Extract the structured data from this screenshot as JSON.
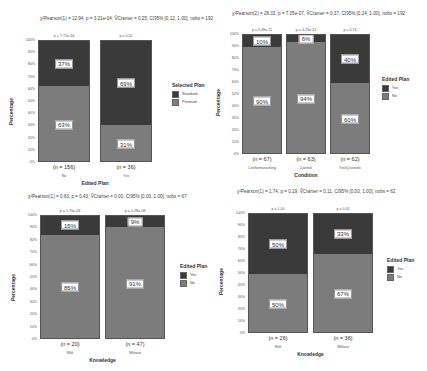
{
  "colors": {
    "dark": "#3a3a3a",
    "light": "#7c7c7c",
    "background": "#ffffff"
  },
  "yticks": [
    "100%",
    "90%",
    "80%",
    "70%",
    "60%",
    "50%",
    "40%",
    "30%",
    "20%",
    "10%",
    "0%"
  ],
  "panels": [
    {
      "subtitle": "χ²Pearson(1) = 12.94, p = 3.21e-04, V̂Cramer = 0.25, CI95% [0.12, 1.00], nobs = 192",
      "ylabel": "Percentage",
      "xlabel": "Edited Plan",
      "legend": {
        "title": "Selected Plan",
        "items": [
          {
            "label": "Standard"
          },
          {
            "label": "Premium"
          }
        ]
      },
      "bars": [
        {
          "category": "No",
          "n": "(n = 156)",
          "p": "p = 7.72e-04",
          "top_pct": 37,
          "bottom_pct": 63,
          "top_label": "37%",
          "bottom_label": "63%"
        },
        {
          "category": "Yes",
          "n": "(n = 36)",
          "p": "p = 0.02",
          "top_pct": 69,
          "bottom_pct": 31,
          "top_label": "69%",
          "bottom_label": "31%"
        }
      ]
    },
    {
      "subtitle": "χ²Pearson(2) = 28.33, p = 7.05e-07, V̂Cramer = 0.37, CI95% [0.24, 1.00], nobs = 192",
      "ylabel": "Percentage",
      "xlabel": "Condition",
      "legend": {
        "title": "Edited Plan",
        "items": [
          {
            "label": "Yes"
          },
          {
            "label": "No"
          }
        ]
      },
      "bars": [
        {
          "category": "Conformanarning",
          "n": "(n = 67)",
          "p": "p = 9.48e-11",
          "top_pct": 10,
          "bottom_pct": 90,
          "top_label": "10%",
          "bottom_label": "90%"
        },
        {
          "category": "Control",
          "n": "(n = 63)",
          "p": "p = 4.23e-12",
          "top_pct": 6,
          "bottom_pct": 94,
          "top_label": "6%",
          "bottom_label": "94%"
        },
        {
          "category": "TrickQuestion",
          "n": "(n = 62)",
          "p": "p = 0.13",
          "top_pct": 40,
          "bottom_pct": 60,
          "top_label": "40%",
          "bottom_label": "60%"
        }
      ]
    },
    {
      "subtitle": "χ²Pearson(1) = 0.63, p = 0.43, V̂Cramer = 0.00, CI95% [0.00, 1.00], nobs = 67",
      "ylabel": "Percentage",
      "xlabel": "Knowledge",
      "legend": {
        "title": "Edited Plan",
        "items": [
          {
            "label": "Yes"
          },
          {
            "label": "No"
          }
        ]
      },
      "bars": [
        {
          "category": "With",
          "n": "(n = 20)",
          "p": "p = 1.75e-03",
          "top_pct": 15,
          "bottom_pct": 85,
          "top_label": "15%",
          "bottom_label": "85%"
        },
        {
          "category": "Without",
          "n": "(n = 47)",
          "p": "p = 1.28e-08",
          "top_pct": 9,
          "bottom_pct": 91,
          "top_label": "9%",
          "bottom_label": "91%"
        }
      ]
    },
    {
      "subtitle": "χ²Pearson(1) = 1.74, p = 0.19, V̂Cramer = 0.11, CI95% [0.00, 1.00], nobs = 62",
      "ylabel": "Percentage",
      "xlabel": "Knowledge",
      "legend": {
        "title": "Edited Plan",
        "items": [
          {
            "label": "Yes"
          },
          {
            "label": "No"
          }
        ]
      },
      "bars": [
        {
          "category": "With",
          "n": "(n = 26)",
          "p": "p = 1.00",
          "top_pct": 50,
          "bottom_pct": 50,
          "top_label": "50%",
          "bottom_label": "50%"
        },
        {
          "category": "Without",
          "n": "(n = 36)",
          "p": "p = 0.05",
          "top_pct": 33,
          "bottom_pct": 67,
          "top_label": "33%",
          "bottom_label": "67%"
        }
      ]
    }
  ],
  "chart_data": [
    {
      "type": "bar",
      "stacked": true,
      "title": "",
      "subtitle": "χ²Pearson(1) = 12.94, p = 3.21e-04, V̂Cramer = 0.25, CI95% [0.12, 1.00], nobs = 192",
      "xlabel": "Edited Plan",
      "ylabel": "Percentage",
      "ylim": [
        0,
        100
      ],
      "categories": [
        "No",
        "Yes"
      ],
      "series": [
        {
          "name": "Standard",
          "values": [
            37,
            69
          ]
        },
        {
          "name": "Premium",
          "values": [
            63,
            31
          ]
        }
      ],
      "annotations": {
        "n": [
          "(n = 156)",
          "(n = 36)"
        ],
        "p": [
          "p = 7.72e-04",
          "p = 0.02"
        ]
      },
      "legend": {
        "title": "Selected Plan",
        "position": "right"
      },
      "grid": false
    },
    {
      "type": "bar",
      "stacked": true,
      "title": "",
      "subtitle": "χ²Pearson(2) = 28.33, p = 7.05e-07, V̂Cramer = 0.37, CI95% [0.24, 1.00], nobs = 192",
      "xlabel": "Condition",
      "ylabel": "Percentage",
      "ylim": [
        0,
        100
      ],
      "categories": [
        "Conformanarning",
        "Control",
        "TrickQuestion"
      ],
      "series": [
        {
          "name": "Yes",
          "values": [
            10,
            6,
            40
          ]
        },
        {
          "name": "No",
          "values": [
            90,
            94,
            60
          ]
        }
      ],
      "annotations": {
        "n": [
          "(n = 67)",
          "(n = 63)",
          "(n = 62)"
        ],
        "p": [
          "p = 9.48e-11",
          "p = 4.23e-12",
          "p = 0.13"
        ]
      },
      "legend": {
        "title": "Edited Plan",
        "position": "right"
      },
      "grid": false
    },
    {
      "type": "bar",
      "stacked": true,
      "title": "",
      "subtitle": "χ²Pearson(1) = 0.63, p = 0.43, V̂Cramer = 0.00, CI95% [0.00, 1.00], nobs = 67",
      "xlabel": "Knowledge",
      "ylabel": "Percentage",
      "ylim": [
        0,
        100
      ],
      "categories": [
        "With",
        "Without"
      ],
      "series": [
        {
          "name": "Yes",
          "values": [
            15,
            9
          ]
        },
        {
          "name": "No",
          "values": [
            85,
            91
          ]
        }
      ],
      "annotations": {
        "n": [
          "(n = 20)",
          "(n = 47)"
        ],
        "p": [
          "p = 1.75e-03",
          "p = 1.28e-08"
        ]
      },
      "legend": {
        "title": "Edited Plan",
        "position": "right"
      },
      "grid": false
    },
    {
      "type": "bar",
      "stacked": true,
      "title": "",
      "subtitle": "χ²Pearson(1) = 1.74, p = 0.19, V̂Cramer = 0.11, CI95% [0.00, 1.00], nobs = 62",
      "xlabel": "Knowledge",
      "ylabel": "Percentage",
      "ylim": [
        0,
        100
      ],
      "categories": [
        "With",
        "Without"
      ],
      "series": [
        {
          "name": "Yes",
          "values": [
            50,
            33
          ]
        },
        {
          "name": "No",
          "values": [
            50,
            67
          ]
        }
      ],
      "annotations": {
        "n": [
          "(n = 26)",
          "(n = 36)"
        ],
        "p": [
          "p = 1.00",
          "p = 0.05"
        ]
      },
      "legend": {
        "title": "Edited Plan",
        "position": "right"
      },
      "grid": false
    }
  ]
}
